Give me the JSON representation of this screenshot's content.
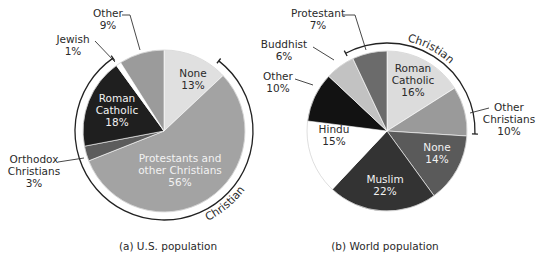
{
  "chart_data": [
    {
      "type": "pie",
      "title": "(a) U.S. population",
      "center": [
        164,
        131
      ],
      "radius": 81,
      "start_angle_deg": 0,
      "direction": "clockwise",
      "slices": [
        {
          "name": "None",
          "value": 13,
          "label": "None\n13%",
          "color": "#e0e0e0",
          "text": "dark",
          "label_pos": [
            193,
            77
          ]
        },
        {
          "name": "Protestants and other Christians",
          "value": 56,
          "label": "Protestants and\nother Christians\n56%",
          "color": "#a3a3a3",
          "text": "light",
          "label_pos": [
            180,
            162
          ]
        },
        {
          "name": "Orthodox Christians",
          "value": 3,
          "label": "Orthodox\nChristians\n3%",
          "color": "#5c5c5c",
          "text": "dark",
          "external": true,
          "label_pos": [
            34,
            163
          ],
          "leader": [
            [
              58,
              162
            ],
            [
              84,
              158
            ]
          ]
        },
        {
          "name": "Roman Catholic",
          "value": 18,
          "label": "Roman\nCatholic\n18%",
          "color": "#1f1f1f",
          "text": "light",
          "label_pos": [
            117,
            102
          ]
        },
        {
          "name": "Jewish",
          "value": 1,
          "label": "Jewish\n1%",
          "color": "#ffffff",
          "text": "dark",
          "external": true,
          "label_pos": [
            73,
            43
          ],
          "leader": [
            [
              95,
              41
            ],
            [
              115,
              62
            ]
          ]
        },
        {
          "name": "Other",
          "value": 9,
          "label": "Other\n9%",
          "color": "#9b9b9b",
          "text": "dark",
          "external": true,
          "label_pos": [
            108,
            17
          ],
          "leader": [
            [
              122,
              15
            ],
            [
              130,
              15
            ],
            [
              140,
              50
            ]
          ]
        }
      ],
      "bracket": {
        "label": "Christian",
        "from_deg": 38,
        "to_deg": 325,
        "radius": 89,
        "label_angle_deg": 140
      },
      "caption": "(a) U.S. population"
    },
    {
      "type": "pie",
      "title": "(b) World population",
      "center": [
        387,
        131
      ],
      "radius": 80,
      "start_angle_deg": 0,
      "direction": "clockwise",
      "slices": [
        {
          "name": "Roman Catholic",
          "value": 16,
          "label": "Roman\nCatholic\n16%",
          "color": "#dcdcdc",
          "text": "dark",
          "label_pos": [
            413,
            72
          ]
        },
        {
          "name": "Other Christians",
          "value": 10,
          "label": "Other\nChristians\n10%",
          "color": "#9a9a9a",
          "text": "dark",
          "external": true,
          "label_pos": [
            509,
            111
          ],
          "leader": [
            [
              489,
              108
            ],
            [
              470,
              113
            ]
          ]
        },
        {
          "name": "None",
          "value": 14,
          "label": "None\n14%",
          "color": "#5a5a5a",
          "text": "light",
          "label_pos": [
            437,
            151
          ]
        },
        {
          "name": "Muslim",
          "value": 22,
          "label": "Muslim\n22%",
          "color": "#333333",
          "text": "light",
          "label_pos": [
            385,
            183
          ]
        },
        {
          "name": "Hindu",
          "value": 15,
          "label": "Hindu\n15%",
          "color": "#ffffff",
          "text": "dark",
          "label_pos": [
            334,
            133
          ]
        },
        {
          "name": "Other",
          "value": 10,
          "label": "Other\n10%",
          "color": "#121212",
          "text": "dark",
          "external": true,
          "label_pos": [
            278,
            80
          ],
          "leader": [
            [
              295,
              79
            ],
            [
              313,
              85
            ]
          ]
        },
        {
          "name": "Buddhist",
          "value": 6,
          "label": "Buddhist\n6%",
          "color": "#c2c2c2",
          "text": "dark",
          "external": true,
          "label_pos": [
            284,
            48
          ],
          "leader": [
            [
              313,
              47
            ],
            [
              334,
              60
            ]
          ]
        },
        {
          "name": "Protestant",
          "value": 7,
          "label": "Protestant\n7%",
          "color": "#6b6b6b",
          "text": "dark",
          "external": true,
          "label_pos": [
            318,
            17
          ],
          "leader": [
            [
              343,
              15
            ],
            [
              355,
              15
            ],
            [
              366,
              50
            ]
          ]
        }
      ],
      "bracket": {
        "label": "Christian",
        "from_deg": 332,
        "to_deg": 92,
        "radius": 88,
        "label_angle_deg": 28
      },
      "caption": "(b) World population"
    }
  ]
}
